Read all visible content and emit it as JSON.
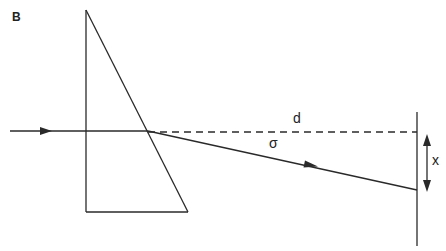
{
  "panel_label": "B",
  "labels": {
    "d": "d",
    "sigma": "σ",
    "x": "x"
  },
  "colors": {
    "line": "#2a2a2a",
    "background": "#ffffff"
  },
  "elements": [
    "prism (right triangle, vertical left edge, horizontal base)",
    "incident ray with arrow",
    "undeviated path (dashed) labeled d",
    "refracted ray with arrow labeled sigma",
    "screen (vertical line)",
    "displacement double arrow labeled x"
  ]
}
